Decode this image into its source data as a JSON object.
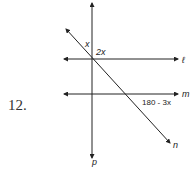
{
  "problem": {
    "number": "12."
  },
  "diagram": {
    "lines": [
      {
        "name": "l",
        "label": "ℓ",
        "type": "horizontal"
      },
      {
        "name": "m",
        "label": "m",
        "type": "horizontal"
      },
      {
        "name": "n",
        "label": "n",
        "type": "transversal-diagonal"
      },
      {
        "name": "p",
        "label": "p",
        "type": "transversal-vertical"
      }
    ],
    "angles": [
      {
        "label": "x",
        "position": "between n and p at l intersection, upper-left"
      },
      {
        "label": "2x",
        "position": "upper-right of p-l intersection"
      },
      {
        "label": "180 - 3x",
        "position": "below m, right of n-m intersection"
      }
    ],
    "colors": {
      "stroke": "#222222",
      "background": "#ffffff"
    }
  }
}
